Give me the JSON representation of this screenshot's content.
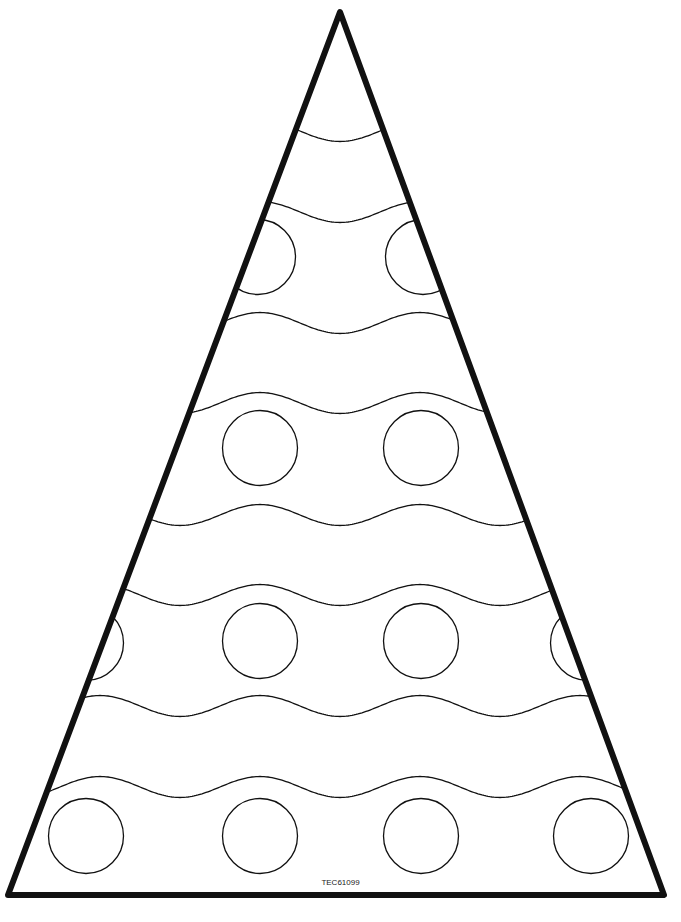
{
  "worksheet": {
    "code_label": "TEC61099",
    "colors": {
      "stroke": "#111111",
      "background": "#ffffff"
    },
    "triangle": {
      "apex": [
        340,
        12
      ],
      "bottom_left": [
        8,
        895
      ],
      "bottom_right": [
        664,
        895
      ],
      "stroke_width": 6
    },
    "wave": {
      "period": 160,
      "amplitude": 10.5,
      "phase_trough_x": 340,
      "stroke_width": 1.3
    },
    "wave_midlines": [
      131,
      212,
      323,
      403,
      515,
      595,
      706,
      787
    ],
    "circle_radius": 37.5,
    "circles": [
      {
        "cx": 258,
        "cy": 257
      },
      {
        "cx": 423,
        "cy": 257
      },
      {
        "cx": 260,
        "cy": 448
      },
      {
        "cx": 421,
        "cy": 448
      },
      {
        "cx": 86,
        "cy": 643
      },
      {
        "cx": 260,
        "cy": 641
      },
      {
        "cx": 421,
        "cy": 641
      },
      {
        "cx": 588,
        "cy": 643
      },
      {
        "cx": 86,
        "cy": 836
      },
      {
        "cx": 260,
        "cy": 836
      },
      {
        "cx": 421,
        "cy": 836
      },
      {
        "cx": 591,
        "cy": 836
      }
    ]
  }
}
